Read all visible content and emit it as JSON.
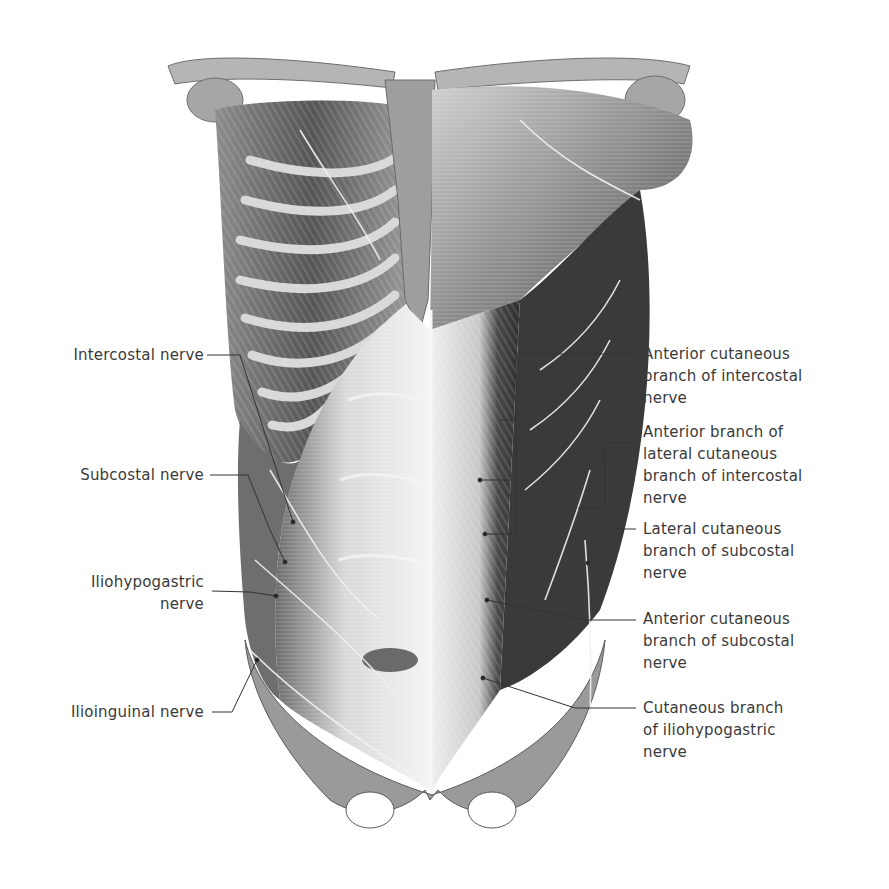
{
  "figure": {
    "colors": {
      "background": "#ffffff",
      "label_text": "#3a3a3a",
      "leader_line": "#333333",
      "muscle_dark": "#3c3c3c",
      "muscle_mid": "#8a8a8a",
      "muscle_light": "#d6d6d6",
      "nerve": "#f2f2f2"
    }
  },
  "labels_left": [
    {
      "id": "intercostal",
      "text": "Intercostal nerve"
    },
    {
      "id": "subcostal",
      "text": "Subcostal nerve"
    },
    {
      "id": "iliohypogastric",
      "text": "Iliohypogastric\nnerve"
    },
    {
      "id": "ilioinguinal",
      "text": "Ilioinguinal nerve"
    }
  ],
  "labels_right": [
    {
      "id": "ant-cut-intercostal",
      "text": "Anterior cutaneous\nbranch of intercostal\nnerve"
    },
    {
      "id": "ant-branch-lat-cut",
      "text": "Anterior branch of\nlateral cutaneous\nbranch of intercostal\nnerve"
    },
    {
      "id": "lat-cut-subcostal",
      "text": "Lateral cutaneous\nbranch of subcostal\nnerve"
    },
    {
      "id": "ant-cut-subcostal",
      "text": "Anterior cutaneous\nbranch of subcostal\nnerve"
    },
    {
      "id": "cut-iliohypogastric",
      "text": "Cutaneous branch\nof iliohypogastric\nnerve"
    }
  ]
}
